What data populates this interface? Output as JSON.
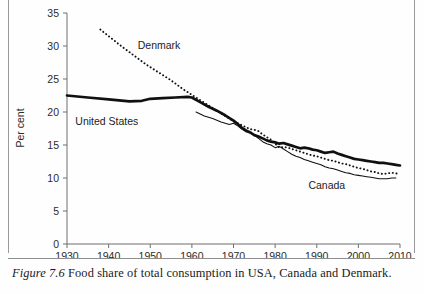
{
  "figure": {
    "caption_label": "Figure 7.6",
    "caption_text": "Food share of total consumption in USA, Canada and Denmark."
  },
  "chart_data": {
    "type": "line",
    "title": "",
    "xlabel": "",
    "ylabel": "Per cent",
    "xlim": [
      1930,
      2010
    ],
    "ylim": [
      0,
      35
    ],
    "grid": false,
    "legend_position": "inline-annotations",
    "xticks": [
      1930,
      1940,
      1950,
      1960,
      1970,
      1980,
      1990,
      2000,
      2010
    ],
    "yticks": [
      0,
      5,
      10,
      15,
      20,
      25,
      30,
      35
    ],
    "annotations": [
      {
        "text": "Denmark",
        "x": 1947,
        "y": 29.5
      },
      {
        "text": "United States",
        "x": 1932,
        "y": 18.0
      },
      {
        "text": "Canada",
        "x": 1988,
        "y": 8.3
      }
    ],
    "series": [
      {
        "name": "United States",
        "style": "thick-solid",
        "color": "#101010",
        "x": [
          1930,
          1935,
          1940,
          1945,
          1948,
          1950,
          1953,
          1956,
          1959,
          1960,
          1962,
          1964,
          1966,
          1968,
          1970,
          1971,
          1972,
          1973,
          1974,
          1975,
          1976,
          1977,
          1978,
          1979,
          1980,
          1981,
          1982,
          1983,
          1984,
          1985,
          1986,
          1987,
          1988,
          1989,
          1990,
          1991,
          1992,
          1993,
          1994,
          1995,
          1996,
          1997,
          1998,
          1999,
          2000,
          2001,
          2002,
          2003,
          2004,
          2005,
          2006,
          2007,
          2008,
          2009,
          2010
        ],
        "y": [
          22.5,
          22.2,
          21.9,
          21.6,
          21.7,
          22.0,
          22.1,
          22.2,
          22.3,
          22.2,
          21.5,
          20.8,
          20.2,
          19.5,
          18.7,
          18.2,
          17.6,
          17.2,
          16.9,
          16.5,
          16.3,
          16.0,
          15.7,
          15.5,
          15.4,
          15.2,
          15.3,
          15.1,
          14.9,
          14.7,
          14.5,
          14.6,
          14.5,
          14.3,
          14.2,
          14.0,
          13.8,
          13.9,
          14.0,
          13.7,
          13.5,
          13.3,
          13.1,
          12.9,
          12.8,
          12.7,
          12.6,
          12.5,
          12.4,
          12.3,
          12.3,
          12.2,
          12.1,
          12.0,
          11.9
        ]
      },
      {
        "name": "Canada",
        "style": "thin-solid",
        "color": "#101010",
        "x": [
          1961,
          1963,
          1965,
          1967,
          1969,
          1970,
          1971,
          1972,
          1973,
          1974,
          1975,
          1976,
          1977,
          1978,
          1979,
          1980,
          1981,
          1982,
          1983,
          1984,
          1985,
          1986,
          1987,
          1988,
          1989,
          1990,
          1991,
          1992,
          1993,
          1994,
          1995,
          1996,
          1997,
          1998,
          1999,
          2000,
          2001,
          2002,
          2003,
          2004,
          2005,
          2006,
          2007,
          2008,
          2009
        ],
        "y": [
          20.0,
          19.4,
          19.0,
          18.5,
          18.1,
          18.3,
          17.9,
          17.4,
          17.0,
          16.9,
          16.5,
          16.0,
          15.5,
          15.2,
          15.0,
          14.6,
          14.8,
          14.4,
          14.0,
          13.6,
          13.3,
          13.1,
          12.8,
          12.6,
          12.4,
          12.2,
          12.0,
          11.7,
          11.5,
          11.4,
          11.2,
          11.0,
          10.8,
          10.7,
          10.5,
          10.4,
          10.3,
          10.2,
          10.1,
          10.0,
          9.9,
          9.9,
          9.9,
          10.0,
          10.0
        ]
      },
      {
        "name": "Denmark",
        "style": "dotted",
        "color": "#111111",
        "x": [
          1938,
          1940,
          1943,
          1946,
          1949,
          1952,
          1955,
          1958,
          1960,
          1962,
          1964,
          1966,
          1968,
          1970,
          1972,
          1974,
          1975,
          1976,
          1977,
          1978,
          1979,
          1980,
          1981,
          1982,
          1983,
          1984,
          1985,
          1986,
          1987,
          1988,
          1989,
          1990,
          1991,
          1992,
          1993,
          1994,
          1995,
          1996,
          1997,
          1998,
          1999,
          2000,
          2001,
          2002,
          2003,
          2004,
          2005,
          2006,
          2007,
          2008,
          2009,
          2010
        ],
        "y": [
          32.5,
          31.5,
          30.0,
          28.6,
          27.2,
          26.0,
          24.8,
          23.4,
          22.6,
          21.8,
          21.0,
          20.2,
          19.4,
          18.6,
          18.0,
          17.4,
          17.3,
          17.1,
          16.6,
          16.2,
          15.8,
          15.2,
          14.6,
          14.7,
          14.6,
          14.4,
          14.2,
          14.0,
          13.8,
          13.6,
          13.4,
          13.3,
          13.1,
          12.9,
          12.7,
          12.6,
          12.4,
          12.2,
          12.1,
          11.9,
          11.7,
          11.5,
          11.4,
          11.2,
          11.0,
          10.9,
          10.7,
          10.6,
          10.7,
          10.8,
          10.7,
          10.6
        ]
      }
    ]
  }
}
